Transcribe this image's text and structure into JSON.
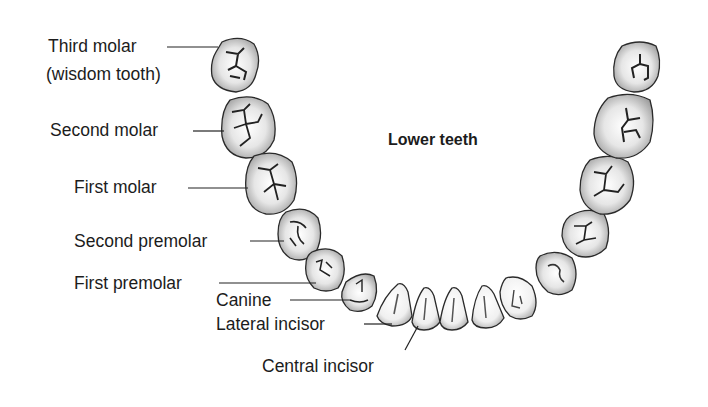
{
  "title": "Lower teeth",
  "labels": {
    "third_molar_line1": "Third molar",
    "third_molar_line2": "(wisdom tooth)",
    "second_molar": "Second molar",
    "first_molar": "First molar",
    "second_premolar": "Second premolar",
    "first_premolar": "First premolar",
    "canine": "Canine",
    "lateral_incisor": "Lateral incisor",
    "central_incisor": "Central incisor"
  },
  "colors": {
    "outline": "#2a2a2a",
    "shade": "#8a8a8a",
    "text": "#1c1c1c",
    "background": "#ffffff"
  }
}
